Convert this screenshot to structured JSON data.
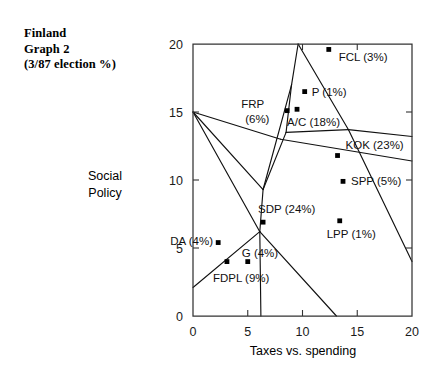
{
  "title": {
    "line1": "Finland",
    "line2": "Graph 2",
    "line3": "(3/87 election %)"
  },
  "axis_titles": {
    "y_line1": "Social",
    "y_line2": "Policy",
    "x": "Taxes vs. spending"
  },
  "chart_data": {
    "type": "scatter",
    "title": "Finland Graph 2 (3/87 election %)",
    "xlabel": "Taxes vs. spending",
    "ylabel": "Social Policy",
    "xlim": [
      0,
      20
    ],
    "ylim": [
      0,
      20
    ],
    "grid": false,
    "legend": "none",
    "xticks": [
      "0",
      "5",
      "10",
      "15",
      "20"
    ],
    "xtick_values": [
      0,
      5,
      10,
      15,
      20
    ],
    "yticks": [
      "0",
      "5",
      "10",
      "15",
      "20"
    ],
    "ytick_values": [
      0,
      5,
      10,
      15,
      20
    ],
    "annotation": "Voronoi-style party-preference regions with party vote shares",
    "points": [
      {
        "name": "FCL",
        "share": "3%",
        "label": "FCL (3%)",
        "x": 12.4,
        "y": 19.6,
        "label_dx": 10,
        "label_dy": 12
      },
      {
        "name": "P",
        "share": "1%",
        "label": "P (1%)",
        "x": 10.2,
        "y": 16.5,
        "label_dx": 7,
        "label_dy": 4
      },
      {
        "name": "FRP",
        "share": "6%",
        "label": "FRP",
        "label2": "(6%)",
        "x": 8.6,
        "y": 15.1,
        "label_dx": -46,
        "label_dy": -3
      },
      {
        "name": "A/C",
        "share": "18%",
        "label": "A/C (18%)",
        "x": 9.5,
        "y": 15.2,
        "label_dx": -10,
        "label_dy": 17
      },
      {
        "name": "KOK",
        "share": "23%",
        "label": "KOK (23%)",
        "x": 13.2,
        "y": 11.8,
        "label_dx": 8,
        "label_dy": -7
      },
      {
        "name": "SPP",
        "share": "5%",
        "label": "SPP (5%)",
        "x": 13.7,
        "y": 9.9,
        "label_dx": 8,
        "label_dy": 4
      },
      {
        "name": "SDP",
        "share": "24%",
        "label": "SDP (24%)",
        "x": 6.4,
        "y": 6.9,
        "label_dx": -5,
        "label_dy": -9
      },
      {
        "name": "LPP",
        "share": "1%",
        "label": "LPP (1%)",
        "x": 13.4,
        "y": 7.0,
        "label_dx": -13,
        "label_dy": 17
      },
      {
        "name": "DA",
        "share": "4%",
        "label": "DA (4%)",
        "x": 2.3,
        "y": 5.4,
        "label_dx": -48,
        "label_dy": 2
      },
      {
        "name": "G",
        "share": "4%",
        "label": "G (4%)",
        "x": 5.0,
        "y": 4.0,
        "label_dx": -6,
        "label_dy": -5
      },
      {
        "name": "FDPL",
        "share": "9%",
        "label": "FDPL (9%)",
        "x": 3.1,
        "y": 4.0,
        "label_dx": -14,
        "label_dy": 20
      }
    ],
    "region_edges": [
      [
        [
          0,
          15.0
        ],
        [
          8.0,
          13.0
        ]
      ],
      [
        [
          8.0,
          13.0
        ],
        [
          20.0,
          11.4
        ]
      ],
      [
        [
          0,
          15.0
        ],
        [
          6.4,
          9.3
        ]
      ],
      [
        [
          6.4,
          9.3
        ],
        [
          9.0,
          17.0
        ]
      ],
      [
        [
          9.0,
          17.0
        ],
        [
          9.6,
          20.0
        ]
      ],
      [
        [
          9.0,
          17.0
        ],
        [
          8.5,
          13.5
        ]
      ],
      [
        [
          8.5,
          13.5
        ],
        [
          6.4,
          9.3
        ]
      ],
      [
        [
          9.6,
          20.0
        ],
        [
          14.2,
          13.7
        ]
      ],
      [
        [
          14.2,
          13.7
        ],
        [
          8.5,
          13.5
        ]
      ],
      [
        [
          14.2,
          13.7
        ],
        [
          20.0,
          13.2
        ]
      ],
      [
        [
          20.0,
          4.0
        ],
        [
          14.2,
          13.7
        ]
      ],
      [
        [
          0,
          15.0
        ],
        [
          6.1,
          6.2
        ]
      ],
      [
        [
          6.1,
          6.2
        ],
        [
          6.4,
          9.3
        ]
      ],
      [
        [
          6.1,
          6.2
        ],
        [
          6.2,
          0.0
        ]
      ],
      [
        [
          6.1,
          6.2
        ],
        [
          13.1,
          0.0
        ]
      ],
      [
        [
          0,
          2.1
        ],
        [
          6.1,
          6.2
        ]
      ]
    ]
  }
}
